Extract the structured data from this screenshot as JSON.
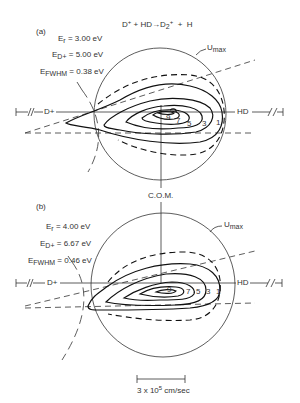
{
  "reaction": {
    "lhs_ion": "D",
    "lhs_ion_charge": "+",
    "plus1": "+",
    "lhs_molecule": "HD",
    "arrow": "→",
    "product": "D",
    "product_sub": "2",
    "product_charge": "+",
    "plus2": "+",
    "product2": "H"
  },
  "panels": [
    {
      "id": "(a)",
      "params": [
        {
          "sym": "E",
          "sub": "r",
          "value": "= 3.00 eV"
        },
        {
          "sym": "E",
          "sub": "D+",
          "value": "= 5.00 eV"
        },
        {
          "sym": "E",
          "sub": "FWHM",
          "value": "= 0.38 eV"
        }
      ],
      "umax_label": "U",
      "umax_sub": "max",
      "left_beam": "D+",
      "right_beam": "HD",
      "contour_labels": [
        "9",
        "7",
        "5",
        "3",
        "1"
      ]
    },
    {
      "id": "(b)",
      "params": [
        {
          "sym": "E",
          "sub": "r",
          "value": "= 4.00 eV"
        },
        {
          "sym": "E",
          "sub": "D+",
          "value": "= 6.67 eV"
        },
        {
          "sym": "E",
          "sub": "FWHM",
          "value": "= 0.46 eV"
        }
      ],
      "umax_label": "U",
      "umax_sub": "max",
      "left_beam": "D+",
      "right_beam": "HD",
      "contour_labels": [
        "9",
        "7",
        "5",
        "3",
        "1"
      ]
    }
  ],
  "com_label": "C.O.M.",
  "scale_bar": {
    "text_pre": "3 x 10",
    "text_exp": "5",
    "text_post": " cm/sec"
  }
}
